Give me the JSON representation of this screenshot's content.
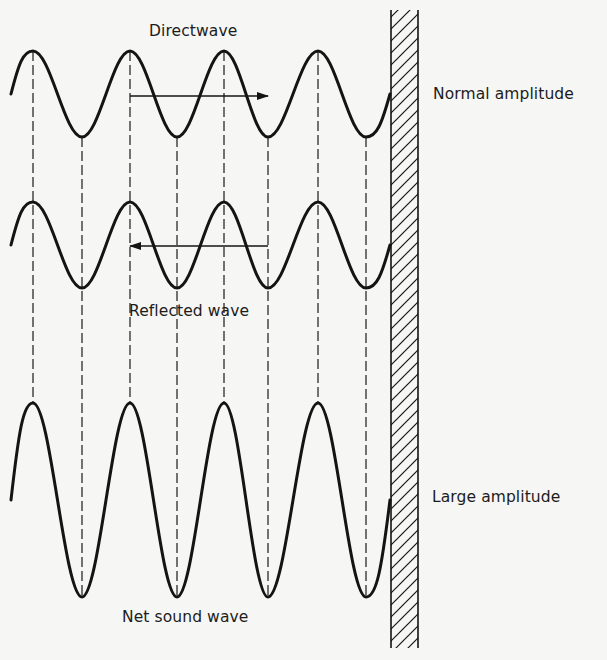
{
  "labels": {
    "direct": "Directwave",
    "reflected": "Reflected wave",
    "net": "Net sound wave",
    "normal": "Normal amplitude",
    "large": "Large amplitude"
  },
  "colors": {
    "background": "#f6f6f4",
    "ink": "#141414"
  },
  "geometry": {
    "peak_x": [
      33,
      130,
      224,
      318
    ],
    "trough_x": [
      82,
      177,
      268,
      366
    ],
    "start_x": 11,
    "end_x": 390,
    "waves": [
      {
        "name": "direct-wave",
        "center_y": 94,
        "amplitude": 43
      },
      {
        "name": "reflected-wave",
        "center_y": 245,
        "amplitude": 43
      },
      {
        "name": "net-sound-wave",
        "center_y": 500,
        "amplitude": 97
      }
    ],
    "direct_arrow": {
      "x1": 130,
      "x2": 268,
      "y": 96,
      "direction": "right"
    },
    "reflected_arrow": {
      "x1": 268,
      "x2": 130,
      "y": 246,
      "direction": "left"
    },
    "dashed_lines": {
      "top_y": 51,
      "bottom_y": 597
    },
    "wall": {
      "x": 391,
      "width": 27,
      "top": 10,
      "bottom": 648
    }
  }
}
